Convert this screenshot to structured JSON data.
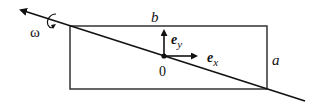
{
  "diagram": {
    "labels": {
      "omega": "ω",
      "side_top": "b",
      "side_right": "a",
      "origin": "0",
      "ex_base": "e",
      "ex_sub": "x",
      "ey_base": "e",
      "ey_sub": "y"
    },
    "colors": {
      "stroke": "#111111",
      "background": "#ffffff"
    }
  }
}
